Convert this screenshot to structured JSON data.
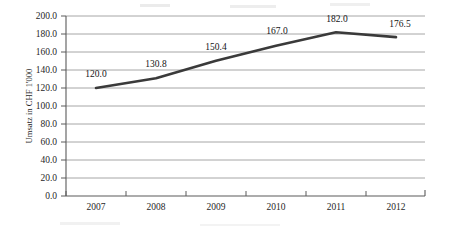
{
  "chart_data": {
    "type": "line",
    "title": "",
    "xlabel": "",
    "ylabel": "Umsatz in CHF 1'000",
    "categories": [
      "2007",
      "2008",
      "2009",
      "2010",
      "2011",
      "2012"
    ],
    "values": [
      120.0,
      130.8,
      150.4,
      167.0,
      182.0,
      176.5
    ],
    "point_labels": [
      "120.0",
      "130.8",
      "150.4",
      "167.0",
      "182.0",
      "176.5"
    ],
    "series": [
      {
        "name": "Umsatz",
        "values": [
          120.0,
          130.8,
          150.4,
          167.0,
          182.0,
          176.5
        ],
        "color": "#3a3a3a"
      }
    ],
    "ylim": [
      0.0,
      200.0
    ],
    "ytick_step": 20.0,
    "ytick_labels": [
      "200.0",
      "180.0",
      "160.0",
      "140.0",
      "120.0",
      "100.0",
      "80.0",
      "60.0",
      "40.0",
      "20.0",
      "0.0"
    ],
    "xtick_labels": [
      "2007",
      "2008",
      "2009",
      "2010",
      "2011",
      "2012"
    ],
    "grid": "horizontal",
    "legend": "none",
    "line_color": "#3a3a3a",
    "gridline_color": "#8f8f8f",
    "axis_color": "#5a5a5a",
    "background_color": "#ffffff",
    "data_labels_shown": true
  },
  "axes": {
    "y_axis_title": "Umsatz in CHF 1'000"
  }
}
